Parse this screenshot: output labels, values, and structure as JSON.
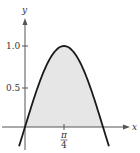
{
  "chart_data": {
    "type": "area",
    "title": "",
    "function_hint": "y = sin(2x)",
    "xlabel": "x",
    "ylabel": "y",
    "x_ticks": [
      {
        "value": 0.7854,
        "label_num": "π",
        "label_den": "4"
      }
    ],
    "y_ticks": [
      {
        "value": 0.5,
        "label": "0.5"
      },
      {
        "value": 1.0,
        "label": "1.0"
      }
    ],
    "x": [
      -0.1,
      0,
      0.1963,
      0.3927,
      0.589,
      0.7854,
      0.9817,
      1.1781,
      1.3744,
      1.5708,
      1.67
    ],
    "values": [
      -0.199,
      0,
      0.383,
      0.707,
      0.924,
      1.0,
      0.924,
      0.707,
      0.383,
      0,
      -0.199
    ],
    "shaded_region": {
      "from": 0,
      "to": 1.5708,
      "color": "#e6e6e6"
    },
    "curve_color": "#1a1a1a",
    "grid": false,
    "legend": "none"
  },
  "labels": {
    "x_axis": "x",
    "y_axis": "y",
    "tick_y_1": "1.0",
    "tick_y_05": "0.5",
    "tick_x_num": "π",
    "tick_x_den": "4"
  }
}
